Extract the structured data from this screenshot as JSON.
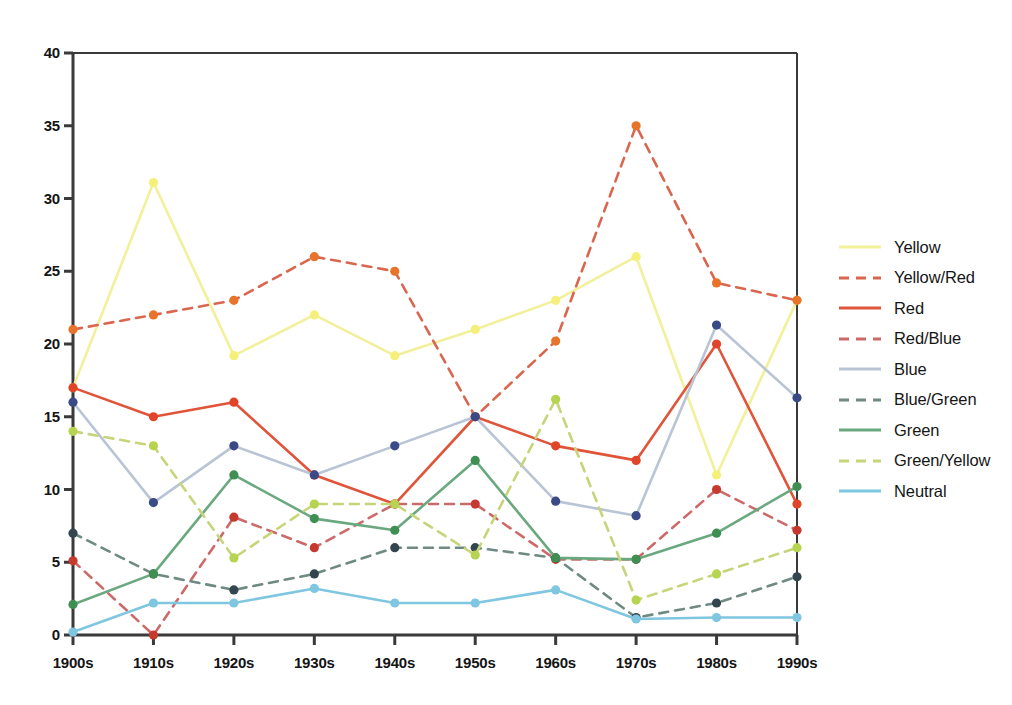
{
  "chart_data": {
    "type": "line",
    "title": "",
    "subtitle": "",
    "xlabel": "",
    "ylabel": "",
    "xlim_categories": [
      "1900s",
      "1910s",
      "1920s",
      "1930s",
      "1940s",
      "1950s",
      "1960s",
      "1970s",
      "1980s",
      "1990s"
    ],
    "ylim": [
      0,
      40
    ],
    "yticks": [
      0,
      5,
      10,
      15,
      20,
      25,
      30,
      35,
      40
    ],
    "grid": false,
    "legend_position": "right",
    "categories": [
      "1900s",
      "1910s",
      "1920s",
      "1930s",
      "1940s",
      "1950s",
      "1960s",
      "1970s",
      "1980s",
      "1990s"
    ],
    "series": [
      {
        "name": "Yellow",
        "color": "#f2f09a",
        "marker_color": "#f4f07a",
        "style": "solid",
        "values": [
          17,
          31.1,
          19.2,
          22,
          19.2,
          21,
          23,
          26,
          11,
          23
        ]
      },
      {
        "name": "Yellow/Red",
        "color": "#d9664f",
        "marker_color": "#e8732b",
        "style": "dashed",
        "values": [
          21,
          22,
          23,
          26,
          25,
          15,
          20.2,
          35,
          24.2,
          23
        ]
      },
      {
        "name": "Red",
        "color": "#e0543a",
        "marker_color": "#e0452a",
        "style": "solid",
        "values": [
          17,
          15,
          16,
          11,
          9,
          15,
          13,
          12,
          20,
          9
        ]
      },
      {
        "name": "Red/Blue",
        "color": "#cc6a6a",
        "marker_color": "#c6392e",
        "style": "dashed",
        "values": [
          5.1,
          0,
          8.1,
          6,
          9,
          9,
          5.2,
          5.2,
          10,
          7.2
        ]
      },
      {
        "name": "Blue",
        "color": "#b9c4d4",
        "marker_color": "#3a4a86",
        "style": "solid",
        "values": [
          16,
          9.1,
          13,
          11,
          13,
          15,
          9.2,
          8.2,
          21.3,
          16.3
        ]
      },
      {
        "name": "Blue/Green",
        "color": "#6e8a82",
        "marker_color": "#33454f",
        "style": "dashed",
        "values": [
          7,
          4.2,
          3.1,
          4.2,
          6,
          6,
          5.3,
          1.2,
          2.2,
          4
        ]
      },
      {
        "name": "Green",
        "color": "#6aa97f",
        "marker_color": "#3f8f52",
        "style": "solid",
        "values": [
          2.1,
          4.2,
          11,
          8,
          7.2,
          12,
          5.3,
          5.2,
          7,
          10.2
        ]
      },
      {
        "name": "Green/Yellow",
        "color": "#c8d479",
        "marker_color": "#b6d44f",
        "style": "dashed",
        "values": [
          14,
          13,
          5.3,
          9,
          9,
          5.5,
          16.2,
          2.4,
          4.2,
          6
        ]
      },
      {
        "name": "Neutral",
        "color": "#7fc6e0",
        "marker_color": "#7fc6e0",
        "style": "solid",
        "values": [
          0.2,
          2.2,
          2.2,
          3.2,
          2.2,
          2.2,
          3.1,
          1.1,
          1.2,
          1.2
        ]
      }
    ]
  },
  "axes": {
    "y_tick_labels": [
      "40",
      "35",
      "30",
      "25",
      "20",
      "15",
      "10",
      "5",
      "0"
    ],
    "x_tick_labels": [
      "1900s",
      "1910s",
      "1920s",
      "1930s",
      "1940s",
      "1950s",
      "1960s",
      "1970s",
      "1980s",
      "1990s"
    ]
  },
  "legend": {
    "entries": [
      {
        "label": "Yellow"
      },
      {
        "label": "Yellow/Red"
      },
      {
        "label": "Red"
      },
      {
        "label": "Red/Blue"
      },
      {
        "label": "Blue"
      },
      {
        "label": "Blue/Green"
      },
      {
        "label": "Green"
      },
      {
        "label": "Green/Yellow"
      },
      {
        "label": "Neutral"
      }
    ]
  }
}
